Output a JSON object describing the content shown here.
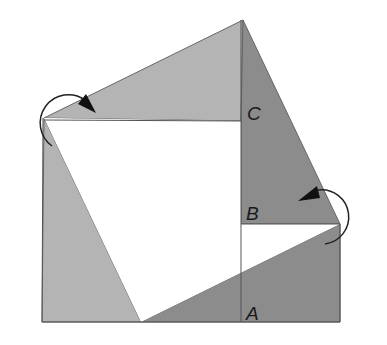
{
  "diagram": {
    "type": "geometric-proof",
    "labels": {
      "c": "C",
      "b": "B",
      "a": "A"
    },
    "colors": {
      "light_gray": "#b4b4b4",
      "dark_gray": "#8a8a8a",
      "white": "#ffffff",
      "stroke": "#555555",
      "arrow": "#222222"
    }
  }
}
